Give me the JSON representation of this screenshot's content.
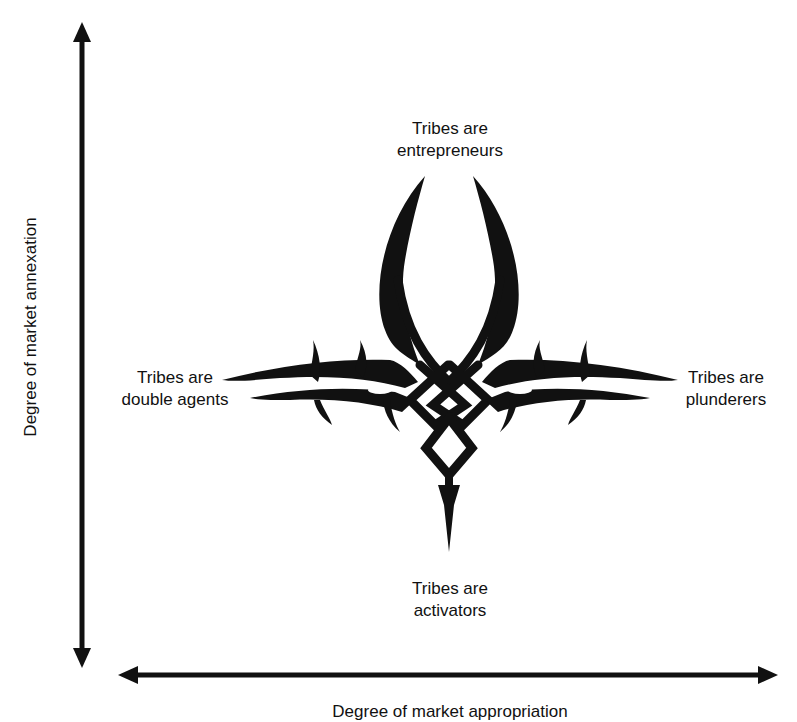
{
  "diagram": {
    "axes": {
      "y_label": "Degree of market annexation",
      "x_label": "Degree of market appropriation"
    },
    "quadrants": {
      "top": {
        "line1": "Tribes are",
        "line2": "entrepreneurs"
      },
      "left": {
        "line1": "Tribes are",
        "line2": "double agents"
      },
      "right": {
        "line1": "Tribes are",
        "line2": "plunderers"
      },
      "bottom": {
        "line1": "Tribes are",
        "line2": "activators"
      }
    },
    "center_graphic": "tribal-knot-ornament-icon",
    "colors": {
      "ink": "#111111",
      "background": "#ffffff"
    }
  }
}
